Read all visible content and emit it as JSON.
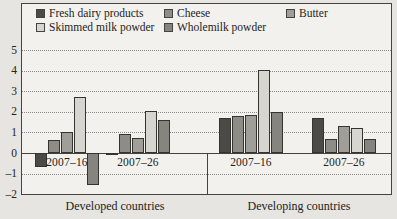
{
  "figure": {
    "background": "#e6e5e1",
    "plot_background": "#f2f1ed",
    "frame_color": "#45433f",
    "grid_color": "#8b8985",
    "text_color": "#242320",
    "bar_border_color": "#36342f"
  },
  "chart_data": {
    "type": "bar",
    "title": "",
    "xlabel": "",
    "ylabel": "",
    "ylim": [
      -2,
      5
    ],
    "yticks": [
      5,
      4,
      3,
      2,
      1,
      0,
      -1,
      -2
    ],
    "ytick_labels": [
      "5",
      "4",
      "3",
      "2",
      "1",
      "0",
      "–1",
      "–2"
    ],
    "grid": "dotted-horizontal",
    "legend_position": "top-left-inside",
    "categories": [
      "2007–16",
      "2007–26",
      "2007–16",
      "2007–26"
    ],
    "group_labels": [
      "Developed countries",
      "Developing countries"
    ],
    "series": [
      {
        "name": "Fresh dairy products",
        "color": "#4b4a46",
        "values": [
          -0.7,
          -0.05,
          1.7,
          1.7
        ]
      },
      {
        "name": "Cheese",
        "color": "#8d8c87",
        "values": [
          0.65,
          0.9,
          1.8,
          0.7
        ]
      },
      {
        "name": "Butter",
        "color": "#9f9e99",
        "values": [
          1.0,
          0.75,
          1.85,
          1.3
        ]
      },
      {
        "name": "Skimmed milk powder",
        "color": "#d6d5d0",
        "values": [
          2.7,
          2.05,
          4.05,
          1.2
        ]
      },
      {
        "name": "Wholemilk powder",
        "color": "#85847f",
        "values": [
          -1.55,
          1.6,
          2.0,
          0.7
        ]
      }
    ]
  }
}
